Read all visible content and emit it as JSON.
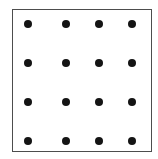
{
  "figure": {
    "canvas": {
      "width": 158,
      "height": 159,
      "background_color": "#ffffff"
    },
    "frame": {
      "name": "square-border",
      "left": 12,
      "top": 9,
      "width": 140,
      "height": 143,
      "border_width": 1,
      "border_color": "#4d4d4d",
      "fill_color": "#ffffff"
    },
    "dots": {
      "rows": 4,
      "columns": 4,
      "count": 16,
      "diameter": 8,
      "color": "#141414",
      "column_centers_x": [
        28,
        66,
        99,
        132
      ],
      "row_centers_y": [
        24,
        63,
        102,
        141
      ],
      "points": [
        {
          "row": 1,
          "col": 1,
          "cx": 28,
          "cy": 24
        },
        {
          "row": 1,
          "col": 2,
          "cx": 66,
          "cy": 24
        },
        {
          "row": 1,
          "col": 3,
          "cx": 99,
          "cy": 24
        },
        {
          "row": 1,
          "col": 4,
          "cx": 132,
          "cy": 24
        },
        {
          "row": 2,
          "col": 1,
          "cx": 28,
          "cy": 63
        },
        {
          "row": 2,
          "col": 2,
          "cx": 66,
          "cy": 63
        },
        {
          "row": 2,
          "col": 3,
          "cx": 99,
          "cy": 63
        },
        {
          "row": 2,
          "col": 4,
          "cx": 132,
          "cy": 63
        },
        {
          "row": 3,
          "col": 1,
          "cx": 28,
          "cy": 102
        },
        {
          "row": 3,
          "col": 2,
          "cx": 66,
          "cy": 102
        },
        {
          "row": 3,
          "col": 3,
          "cx": 99,
          "cy": 102
        },
        {
          "row": 3,
          "col": 4,
          "cx": 132,
          "cy": 102
        },
        {
          "row": 4,
          "col": 1,
          "cx": 28,
          "cy": 141
        },
        {
          "row": 4,
          "col": 2,
          "cx": 66,
          "cy": 141
        },
        {
          "row": 4,
          "col": 3,
          "cx": 99,
          "cy": 141
        },
        {
          "row": 4,
          "col": 4,
          "cx": 132,
          "cy": 141
        }
      ]
    }
  }
}
